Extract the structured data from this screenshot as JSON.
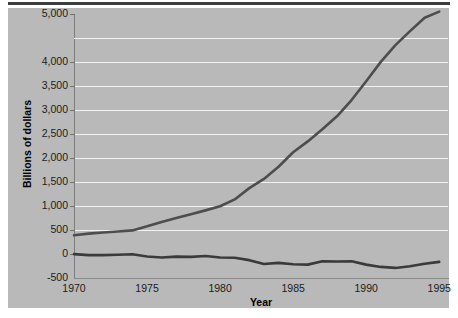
{
  "chart_data": {
    "type": "line",
    "title": "",
    "xlabel": "Year",
    "ylabel": "Billions of dollars",
    "xlim": [
      1970,
      1995.6
    ],
    "ylim": [
      -500,
      5000
    ],
    "grid": true,
    "legend": false,
    "xticks": [
      "1970",
      "1975",
      "1980",
      "1985",
      "1990",
      "1995"
    ],
    "xtick_values": [
      1970,
      1975,
      1980,
      1985,
      1990,
      1995
    ],
    "yticks": [
      "5,000",
      "4,000",
      "3,500",
      "3,000",
      "2,500",
      "2,000",
      "1,500",
      "1,000",
      "500",
      "0",
      "-500"
    ],
    "ytick_values": [
      5000,
      4000,
      3500,
      3000,
      2500,
      2000,
      1500,
      1000,
      500,
      0,
      -500
    ],
    "gridline_values": [
      4500,
      4000,
      3500,
      3000,
      2500,
      2000,
      1500,
      1000,
      500
    ],
    "x": [
      1970,
      1971,
      1972,
      1973,
      1974,
      1975,
      1976,
      1977,
      1978,
      1979,
      1980,
      1981,
      1982,
      1983,
      1984,
      1985,
      1986,
      1987,
      1988,
      1989,
      1990,
      1991,
      1992,
      1993,
      1994,
      1995
    ],
    "series": [
      {
        "name": "Gross federal debt",
        "color": "#4d4d4d",
        "values": [
          389,
          424,
          449,
          469,
          492,
          576,
          669,
          749,
          829,
          909,
          994,
          1137,
          1372,
          1565,
          1817,
          2120,
          2346,
          2601,
          2868,
          3207,
          3598,
          4002,
          4351,
          4643,
          4921,
          5050
        ]
      },
      {
        "name": "Annual deficit",
        "color": "#3a3a3a",
        "values": [
          -3,
          -23,
          -23,
          -15,
          -6,
          -53,
          -74,
          -54,
          -59,
          -41,
          -74,
          -79,
          -128,
          -208,
          -185,
          -212,
          -221,
          -150,
          -155,
          -153,
          -221,
          -269,
          -290,
          -255,
          -203,
          -164
        ]
      }
    ]
  },
  "axis_titles": {
    "x": "Year",
    "y": "Billions of dollars"
  }
}
